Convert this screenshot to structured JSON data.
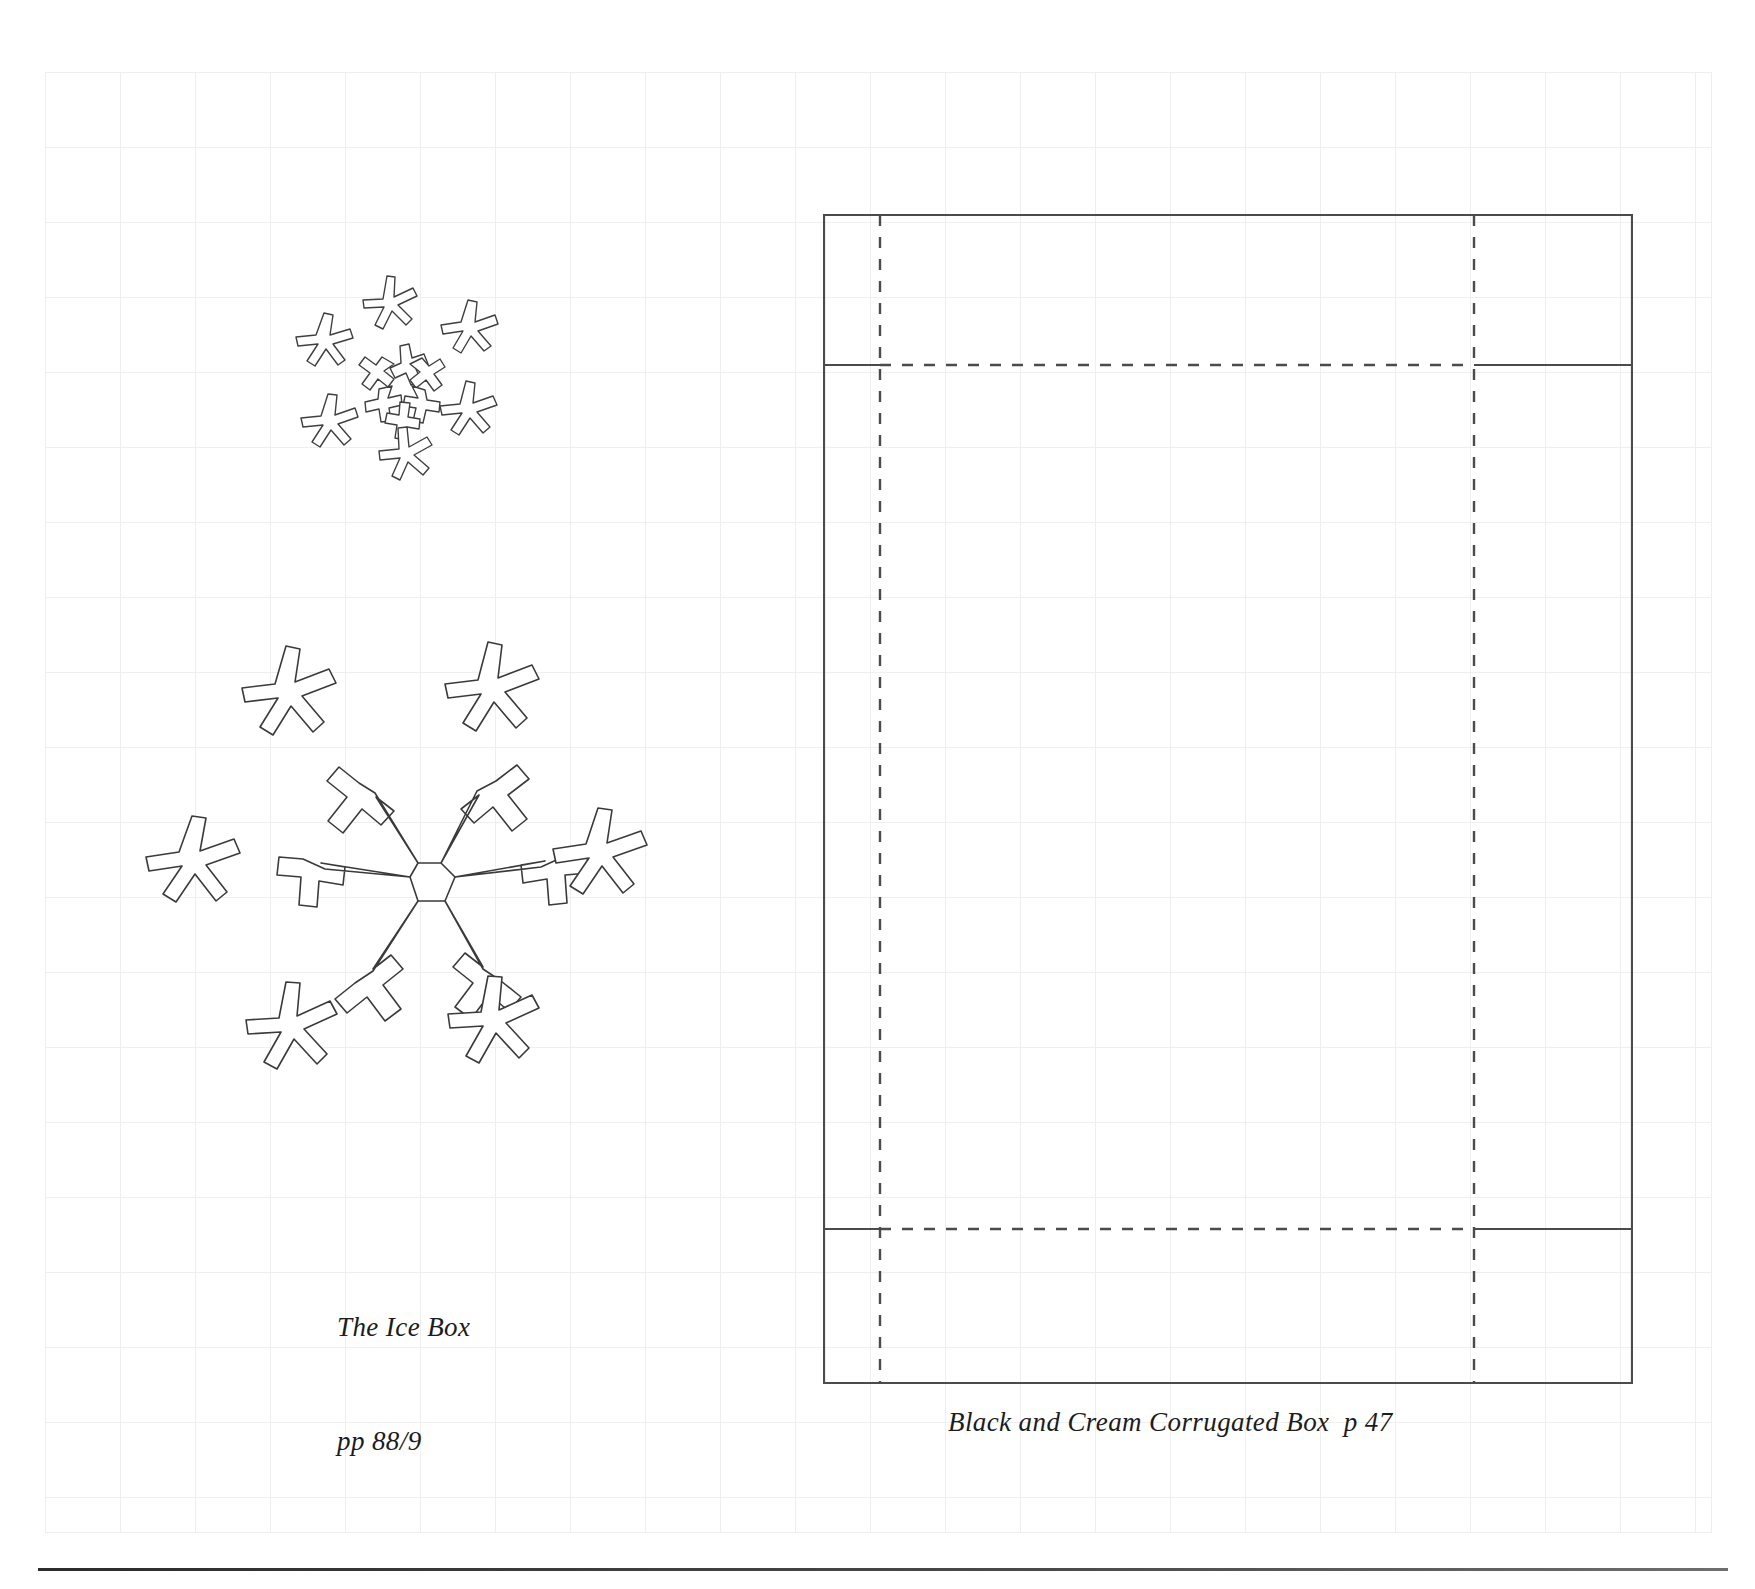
{
  "page": {
    "background_color": "#ffffff",
    "grid_color": "#efefef",
    "ink_color": "#3a3a3a",
    "rule_color": "#2c2c2c"
  },
  "captions": {
    "icebox_line1": "The Ice Box",
    "icebox_line2": "pp 88/9",
    "box_caption": "Black and Cream Corrugated Box  p 47"
  },
  "artwork": {
    "small_snowflake_cluster": {
      "name": "snowflake-cluster-small",
      "description": "small six-point snowflake surrounded by six small six-point stars"
    },
    "large_snowflake_cluster": {
      "name": "snowflake-cluster-large",
      "description": "large six-point snowflake with cross-shaped tips surrounded by six six-point stars"
    }
  },
  "box_diagram": {
    "name": "corrugated-box-dieline",
    "cut_lines": "solid",
    "fold_lines": "dashed",
    "panels": [
      "top-flap",
      "left-end",
      "main-panel",
      "right-end",
      "bottom-flap"
    ]
  }
}
